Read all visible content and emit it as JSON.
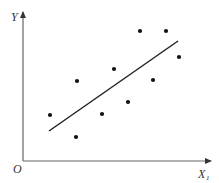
{
  "chart_data": {
    "type": "scatter",
    "title": "",
    "xlabel": "X",
    "xlabel_subscript": "1",
    "ylabel": "Y",
    "origin_label": "O",
    "grid": false,
    "legend": null,
    "ticks": {
      "x": [],
      "y": []
    },
    "note": "Unlabeled axes; coordinates are in pixel-derived relative units (origin at O).",
    "points": [
      {
        "x": 27,
        "y": 46
      },
      {
        "x": 53,
        "y": 24
      },
      {
        "x": 54,
        "y": 80
      },
      {
        "x": 79,
        "y": 47
      },
      {
        "x": 91,
        "y": 92
      },
      {
        "x": 105,
        "y": 59
      },
      {
        "x": 117,
        "y": 130
      },
      {
        "x": 130,
        "y": 81
      },
      {
        "x": 143,
        "y": 130
      },
      {
        "x": 156,
        "y": 104
      }
    ],
    "regression_line": {
      "start": {
        "x": 26,
        "y": 30
      },
      "end": {
        "x": 155,
        "y": 120
      }
    }
  },
  "colors": {
    "axis": "#555555",
    "point": "#111111",
    "line": "#222222",
    "background": "#ffffff"
  }
}
